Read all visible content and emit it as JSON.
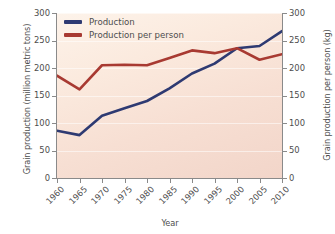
{
  "chart_data": {
    "type": "line",
    "title": "",
    "xlabel": "Year",
    "ylabel": "Grain production (million metric tons)",
    "ylabel_right": "Grain production per person (kg)",
    "categories": [
      1960,
      1965,
      1970,
      1975,
      1980,
      1985,
      1990,
      1995,
      2000,
      2005,
      2010
    ],
    "x": [
      "1960",
      "1965",
      "1970",
      "1975",
      "1980",
      "1985",
      "1990",
      "1995",
      "2000",
      "2005",
      "2010"
    ],
    "xlim": [
      1960,
      2010
    ],
    "ylim": [
      0,
      300
    ],
    "ylim_right": [
      0,
      300
    ],
    "yticks": [
      "0",
      "50",
      "100",
      "150",
      "200",
      "250",
      "300"
    ],
    "ytick_values": [
      0,
      50,
      100,
      150,
      200,
      250,
      300
    ],
    "yticks_right": [
      "0",
      "50",
      "100",
      "150",
      "200",
      "250",
      "300"
    ],
    "grid": true,
    "grid_axis": "y",
    "legend_position": "top-left",
    "series": [
      {
        "name": "Production",
        "axis": "left",
        "color": "#2e3a72",
        "units": "million metric tons",
        "values": [
          86,
          78,
          113,
          127,
          140,
          163,
          190,
          208,
          236,
          240,
          267
        ]
      },
      {
        "name": "Production per person",
        "axis": "right",
        "color": "#a83a32",
        "units": "kg",
        "values": [
          186,
          161,
          205,
          206,
          205,
          218,
          232,
          227,
          236,
          215,
          225
        ]
      }
    ]
  },
  "legend": {
    "items": [
      {
        "label": "Production",
        "color": "#2e3a72"
      },
      {
        "label": "Production per person",
        "color": "#a83a32"
      }
    ]
  },
  "axes": {
    "left_title": "Grain production (million metric tons)",
    "right_title": "Grain production per person (kg)",
    "bottom_title": "Year"
  },
  "colors": {
    "series_production": "#2e3a72",
    "series_per_person": "#a83a32",
    "plot_background_top": "#fdf3ea",
    "plot_background_bottom": "#f2d5c9",
    "axis": "#8a8a8a",
    "text": "#4d4d4d"
  }
}
